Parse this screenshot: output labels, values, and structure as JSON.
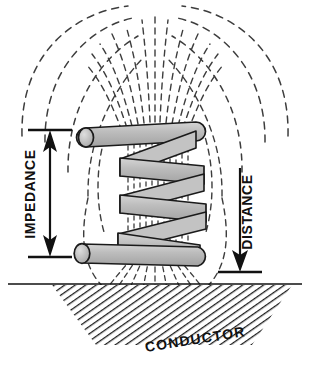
{
  "diagram": {
    "labels": {
      "impedance": "IMPEDANCE",
      "distance": "DISTANCE",
      "conductor": "CONDUCTOR",
      "eddy_currents_obscured": ""
    },
    "colors": {
      "ink": "#111111",
      "coil_fill": "#b8b8b8",
      "coil_outline": "#1a1a1a",
      "field_line": "#444444",
      "hatch": "#222222",
      "background": "#ffffff"
    },
    "elements": {
      "coil_turns": 4,
      "coil_leads": 2,
      "field_arcs_per_side": 4,
      "core_field_lines": 13,
      "impedance_arrow": "double-headed-vertical",
      "distance_arrow": "single-headed-down",
      "conductor_hatch": "diagonal-lines"
    }
  }
}
